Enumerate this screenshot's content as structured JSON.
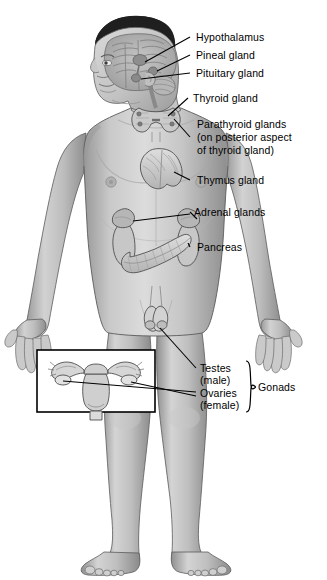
{
  "figure": {
    "background_color": "#ffffff",
    "skin_tone": "#b9b9b9",
    "skin_tone_light": "#d8d8d8",
    "skin_tone_shadow": "#8f8f8f",
    "outline_color": "#4a4a4a",
    "organ_fill": "#cfcfcf",
    "hair_color": "#2b2b2b",
    "leader_line_color": "#000000"
  },
  "labels": {
    "hypothalamus": "Hypothalamus",
    "pineal": "Pineal gland",
    "pituitary": "Pituitary gland",
    "thyroid": "Thyroid gland",
    "parathyroid_line1": "Parathyroid glands",
    "parathyroid_line2": "(on posterior aspect",
    "parathyroid_line3": "of thyroid gland)",
    "thymus": "Thymus gland",
    "adrenal": "Adrenal glands",
    "pancreas": "Pancreas",
    "testes_line1": "Testes",
    "testes_line2": "(male)",
    "ovaries_line1": "Ovaries",
    "ovaries_line2": "(female)",
    "gonads": "Gonads"
  },
  "inset": {
    "name": "female-reproductive-organs-inset",
    "contents": "uterus with fallopian tubes and ovaries",
    "border_color": "#000000"
  },
  "organs": [
    {
      "name": "hypothalamus",
      "region": "brain"
    },
    {
      "name": "pineal-gland",
      "region": "brain"
    },
    {
      "name": "pituitary-gland",
      "region": "brain"
    },
    {
      "name": "thyroid-gland",
      "region": "neck"
    },
    {
      "name": "parathyroid-glands",
      "region": "neck-posterior"
    },
    {
      "name": "thymus-gland",
      "region": "chest"
    },
    {
      "name": "adrenal-glands",
      "region": "abdomen"
    },
    {
      "name": "pancreas",
      "region": "abdomen"
    },
    {
      "name": "testes",
      "region": "groin"
    },
    {
      "name": "ovaries",
      "region": "pelvis-inset"
    }
  ]
}
